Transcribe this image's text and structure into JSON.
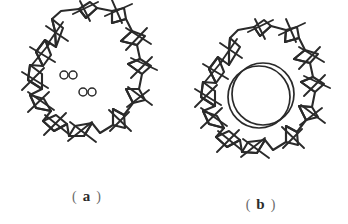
{
  "figure": {
    "ink_color": "#2a2a2a",
    "background_color": "#ffffff",
    "panels": [
      {
        "id": "a",
        "caption_open_paren": "(",
        "caption_letter": "a",
        "caption_close_paren": ")",
        "subject": "hand-drawn cogwheel ring with four small bore holes",
        "tooth_count": 12,
        "center_feature": "four-small-circles",
        "small_circles": [
          {
            "cx": 64,
            "cy": 75,
            "r": 4
          },
          {
            "cx": 73,
            "cy": 75,
            "r": 4
          },
          {
            "cx": 83,
            "cy": 92,
            "r": 4
          },
          {
            "cx": 92,
            "cy": 92,
            "r": 4
          }
        ]
      },
      {
        "id": "b",
        "caption_open_paren": "(",
        "caption_letter": "b",
        "caption_close_paren": ")",
        "subject": "hand-drawn cogwheel ring with large central bore",
        "tooth_count": 12,
        "center_feature": "large-double-circle",
        "bore_circles": [
          {
            "cx": 85,
            "cy": 97,
            "r": 31
          },
          {
            "cx": 89,
            "cy": 94,
            "r": 31
          }
        ]
      }
    ]
  }
}
